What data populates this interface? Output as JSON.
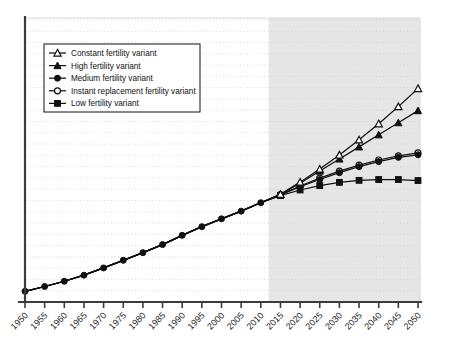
{
  "chart_data": {
    "type": "line",
    "title": "",
    "subtitle": "",
    "xlabel": "",
    "ylabel": "",
    "grid": true,
    "legend_position": "top-left",
    "xlim": [
      1950,
      2050
    ],
    "ylim": [
      2.0,
      16.0
    ],
    "x_tick_step": 5,
    "historical_end": 2012,
    "forecast_shaded_from": 2012,
    "x": [
      1950,
      1955,
      1960,
      1965,
      1970,
      1975,
      1980,
      1985,
      1990,
      1995,
      2000,
      2005,
      2010,
      2015,
      2020,
      2025,
      2030,
      2035,
      2040,
      2045,
      2050
    ],
    "tick_labels": [
      "1950",
      "1955",
      "1960",
      "1965",
      "1970",
      "1975",
      "1980",
      "1985",
      "1990",
      "1995",
      "2000",
      "2005",
      "2010",
      "2015",
      "2020",
      "2025",
      "2030",
      "2035",
      "2040",
      "2045",
      "2050"
    ],
    "series": [
      {
        "name": "Constant fertility variant",
        "marker": "triangle-open",
        "values": [
          2.53,
          2.77,
          3.03,
          3.33,
          3.69,
          4.07,
          4.45,
          4.85,
          5.31,
          5.74,
          6.13,
          6.51,
          6.93,
          7.35,
          7.95,
          8.6,
          9.3,
          10.05,
          10.85,
          11.7,
          12.6
        ]
      },
      {
        "name": "High fertility variant",
        "marker": "triangle-filled",
        "values": [
          2.53,
          2.77,
          3.03,
          3.33,
          3.69,
          4.07,
          4.45,
          4.85,
          5.31,
          5.74,
          6.13,
          6.51,
          6.93,
          7.35,
          7.9,
          8.5,
          9.1,
          9.7,
          10.3,
          10.9,
          11.5
        ]
      },
      {
        "name": "Medium fertility variant",
        "marker": "circle-filled",
        "values": [
          2.53,
          2.77,
          3.03,
          3.33,
          3.69,
          4.07,
          4.45,
          4.85,
          5.31,
          5.74,
          6.13,
          6.51,
          6.93,
          7.32,
          7.72,
          8.08,
          8.42,
          8.72,
          8.97,
          9.18,
          9.31
        ]
      },
      {
        "name": "Instant replacement fertility variant",
        "marker": "circle-open",
        "values": [
          2.53,
          2.77,
          3.03,
          3.33,
          3.69,
          4.07,
          4.45,
          4.85,
          5.31,
          5.74,
          6.13,
          6.51,
          6.93,
          7.33,
          7.76,
          8.15,
          8.5,
          8.8,
          9.05,
          9.25,
          9.4
        ]
      },
      {
        "name": "Low fertility variant",
        "marker": "square-filled",
        "values": [
          2.53,
          2.77,
          3.03,
          3.33,
          3.69,
          4.07,
          4.45,
          4.85,
          5.31,
          5.74,
          6.13,
          6.51,
          6.93,
          7.28,
          7.56,
          7.78,
          7.94,
          8.04,
          8.08,
          8.08,
          8.03
        ]
      }
    ]
  },
  "legend": {
    "items": [
      {
        "label": "Constant fertility variant",
        "marker": "triangle-open"
      },
      {
        "label": "High fertility variant",
        "marker": "triangle-filled"
      },
      {
        "label": "Medium fertility variant",
        "marker": "circle-filled"
      },
      {
        "label": "Instant replacement fertility variant",
        "marker": "circle-open"
      },
      {
        "label": "Low fertility variant",
        "marker": "square-filled"
      }
    ]
  },
  "colors": {
    "line": "#111111",
    "grid": "#cfcfcf",
    "axis": "#3c3c3c",
    "forecast_band": "#e6e6e6",
    "background": "#ffffff"
  }
}
